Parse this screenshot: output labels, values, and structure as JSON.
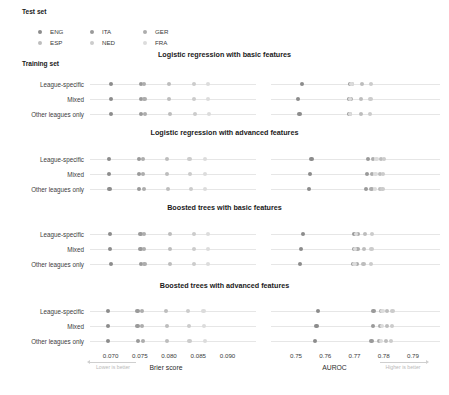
{
  "legend": {
    "test_set_label": "Test set",
    "training_set_label": "Training set",
    "entries": [
      {
        "code": "ENG",
        "color": "#8c8c8c"
      },
      {
        "code": "ITA",
        "color": "#9a9a9a"
      },
      {
        "code": "GER",
        "color": "#adadad"
      },
      {
        "code": "ESP",
        "color": "#bdbdbd"
      },
      {
        "code": "NED",
        "color": "#cccccc"
      },
      {
        "code": "FRA",
        "color": "#dcdcdc"
      }
    ]
  },
  "rows": [
    "League-specific",
    "Mixed",
    "Other leagues only"
  ],
  "axes": {
    "brier": {
      "name": "Brier score",
      "hint": "Lower is better",
      "ticks": [
        "0.070",
        "0.075",
        "0.080",
        "0.085",
        "0.090"
      ],
      "tick_values": [
        0.07,
        0.075,
        0.08,
        0.085,
        0.09
      ],
      "range": [
        0.0675,
        0.0935
      ]
    },
    "auroc": {
      "name": "AUROC",
      "hint": "Higher is better",
      "ticks": [
        "0.75",
        "0.76",
        "0.77",
        "0.78",
        "0.79"
      ],
      "tick_values": [
        0.75,
        0.76,
        0.77,
        0.78,
        0.79
      ],
      "range": [
        0.7435,
        0.7965
      ]
    }
  },
  "chart_data": {
    "type": "scatter",
    "xlabel": "Brier score / AUROC",
    "ylabel": "Training set",
    "grid": false,
    "legend_position": "top-left",
    "series_names": [
      "ENG",
      "ITA",
      "GER",
      "ESP",
      "NED",
      "FRA"
    ],
    "categories": [
      "League-specific",
      "Mixed",
      "Other leagues only"
    ],
    "panels": [
      {
        "title": "Logistic regression with basic features",
        "brier": {
          "League-specific": {
            "ENG": 0.07,
            "ITA": 0.0752,
            "GER": 0.0757,
            "ESP": 0.08,
            "NED": 0.0843,
            "FRA": 0.0867
          },
          "Mixed": {
            "ENG": 0.07,
            "ITA": 0.0752,
            "GER": 0.0758,
            "ESP": 0.08,
            "NED": 0.0843,
            "FRA": 0.0867
          },
          "Other leagues only": {
            "ENG": 0.0701,
            "ITA": 0.0752,
            "GER": 0.0759,
            "ESP": 0.0801,
            "NED": 0.0844,
            "FRA": 0.0868
          }
        },
        "auroc": {
          "League-specific": {
            "ENG": 0.752,
            "ITA": 0.7684,
            "GER": 0.769,
            "ESP": 0.7725,
            "NED": 0.7757,
            "FRA": 0.769
          },
          "Mixed": {
            "ENG": 0.7508,
            "ITA": 0.7682,
            "GER": 0.7688,
            "ESP": 0.7723,
            "NED": 0.7755,
            "FRA": 0.7686
          },
          "Other leagues only": {
            "ENG": 0.7512,
            "ITA": 0.768,
            "GER": 0.7686,
            "ESP": 0.7722,
            "NED": 0.7754,
            "FRA": 0.7684
          }
        }
      },
      {
        "title": "Logistic regression with advanced features",
        "brier": {
          "League-specific": {
            "ENG": 0.0697,
            "ITA": 0.0748,
            "GER": 0.0755,
            "ESP": 0.0797,
            "NED": 0.0835,
            "FRA": 0.0861
          },
          "Mixed": {
            "ENG": 0.0697,
            "ITA": 0.0748,
            "GER": 0.0756,
            "ESP": 0.0797,
            "NED": 0.0836,
            "FRA": 0.0862
          },
          "Other leagues only": {
            "ENG": 0.0698,
            "ITA": 0.0749,
            "GER": 0.0757,
            "ESP": 0.0798,
            "NED": 0.0838,
            "FRA": 0.0862
          }
        },
        "auroc": {
          "League-specific": {
            "ENG": 0.7553,
            "ITA": 0.7745,
            "GER": 0.7762,
            "ESP": 0.779,
            "NED": 0.78,
            "FRA": 0.7775
          },
          "Mixed": {
            "ENG": 0.7548,
            "ITA": 0.7742,
            "GER": 0.776,
            "ESP": 0.7788,
            "NED": 0.7798,
            "FRA": 0.7772
          },
          "Other leagues only": {
            "ENG": 0.7545,
            "ITA": 0.774,
            "GER": 0.7758,
            "ESP": 0.7786,
            "NED": 0.7796,
            "FRA": 0.777
          }
        }
      },
      {
        "title": "Boosted trees with basic features",
        "brier": {
          "League-specific": {
            "ENG": 0.0699,
            "ITA": 0.0751,
            "GER": 0.0757,
            "ESP": 0.0801,
            "NED": 0.0842,
            "FRA": 0.0866
          },
          "Mixed": {
            "ENG": 0.0699,
            "ITA": 0.0751,
            "GER": 0.0757,
            "ESP": 0.0801,
            "NED": 0.0842,
            "FRA": 0.0866
          },
          "Other leagues only": {
            "ENG": 0.07,
            "ITA": 0.0752,
            "GER": 0.0758,
            "ESP": 0.0802,
            "NED": 0.0843,
            "FRA": 0.0867
          }
        },
        "auroc": {
          "League-specific": {
            "ENG": 0.7525,
            "ITA": 0.77,
            "GER": 0.7712,
            "ESP": 0.7735,
            "NED": 0.776,
            "FRA": 0.7705
          },
          "Mixed": {
            "ENG": 0.7518,
            "ITA": 0.7697,
            "GER": 0.771,
            "ESP": 0.7733,
            "NED": 0.7758,
            "FRA": 0.7702
          },
          "Other leagues only": {
            "ENG": 0.7515,
            "ITA": 0.7694,
            "GER": 0.7708,
            "ESP": 0.7731,
            "NED": 0.7756,
            "FRA": 0.77
          }
        }
      },
      {
        "title": "Boosted trees with advanced features",
        "brier": {
          "League-specific": {
            "ENG": 0.0695,
            "ITA": 0.0746,
            "GER": 0.0754,
            "ESP": 0.0795,
            "NED": 0.0833,
            "FRA": 0.0859
          },
          "Mixed": {
            "ENG": 0.0695,
            "ITA": 0.0746,
            "GER": 0.0754,
            "ESP": 0.0796,
            "NED": 0.0834,
            "FRA": 0.086
          },
          "Other leagues only": {
            "ENG": 0.0696,
            "ITA": 0.0747,
            "GER": 0.0755,
            "ESP": 0.0797,
            "NED": 0.0835,
            "FRA": 0.0861
          }
        },
        "auroc": {
          "League-specific": {
            "ENG": 0.7575,
            "ITA": 0.7765,
            "GER": 0.779,
            "ESP": 0.7812,
            "NED": 0.783,
            "FRA": 0.7796
          },
          "Mixed": {
            "ENG": 0.757,
            "ITA": 0.7762,
            "GER": 0.7788,
            "ESP": 0.781,
            "NED": 0.7828,
            "FRA": 0.7793
          },
          "Other leagues only": {
            "ENG": 0.7566,
            "ITA": 0.7758,
            "GER": 0.7785,
            "ESP": 0.7807,
            "NED": 0.7825,
            "FRA": 0.779
          }
        }
      }
    ]
  }
}
